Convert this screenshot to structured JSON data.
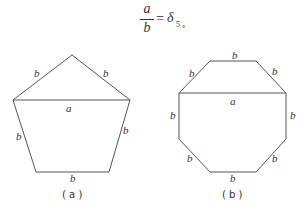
{
  "formula": {
    "numerator": "a",
    "denominator": "b",
    "equals": "=",
    "symbol": "δ",
    "subscript": "5 。"
  },
  "figure_a": {
    "shape": "pentagon",
    "side_label": "b",
    "diagonal_label": "a",
    "caption": "( a )"
  },
  "figure_b": {
    "shape": "octagon",
    "side_label": "b",
    "diagonal_label": "a",
    "caption": "( b )"
  },
  "colors": {
    "stroke": "#555555",
    "text": "#333333"
  }
}
